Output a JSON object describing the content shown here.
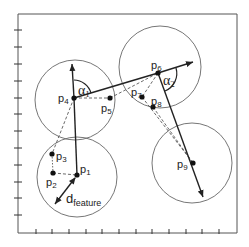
{
  "diagram": {
    "frame": {
      "left": 18,
      "top": 14,
      "right": 237,
      "bottom": 233
    },
    "ticks": {
      "left_y": [
        30,
        47,
        64,
        81,
        98,
        114,
        131,
        148,
        165,
        182,
        198,
        215
      ],
      "bottom_x": [
        36,
        52,
        69,
        86,
        102,
        119,
        136,
        152,
        169,
        186,
        202,
        219
      ]
    },
    "points": [
      {
        "id": "p1",
        "label": "p",
        "sub": "1",
        "x": 77,
        "y": 175
      },
      {
        "id": "p2",
        "label": "p",
        "sub": "2",
        "x": 53,
        "y": 173
      },
      {
        "id": "p3",
        "label": "p",
        "sub": "3",
        "x": 52,
        "y": 154
      },
      {
        "id": "p4",
        "label": "p",
        "sub": "4",
        "x": 74,
        "y": 98
      },
      {
        "id": "p5",
        "label": "p",
        "sub": "5",
        "x": 110,
        "y": 98
      },
      {
        "id": "p6",
        "label": "p",
        "sub": "6",
        "x": 158,
        "y": 73
      },
      {
        "id": "p7",
        "label": "p",
        "sub": "7",
        "x": 142,
        "y": 97
      },
      {
        "id": "p8",
        "label": "p",
        "sub": "8",
        "x": 153,
        "y": 107
      },
      {
        "id": "p9",
        "label": "p",
        "sub": "9",
        "x": 193,
        "y": 163
      }
    ],
    "circles": [
      {
        "cx": 77,
        "cy": 177,
        "r": 40
      },
      {
        "cx": 75,
        "cy": 100,
        "r": 40
      },
      {
        "cx": 160,
        "cy": 67,
        "r": 41
      },
      {
        "cx": 192,
        "cy": 163,
        "r": 40
      }
    ],
    "angles": [
      {
        "symbol": "α",
        "sub": "1"
      },
      {
        "symbol": "α",
        "sub": "2"
      }
    ],
    "distance_label": {
      "symbol": "d",
      "sub": "feature"
    },
    "colors": {
      "line": "#222222",
      "circle": "#555555",
      "background": "#ffffff"
    }
  }
}
